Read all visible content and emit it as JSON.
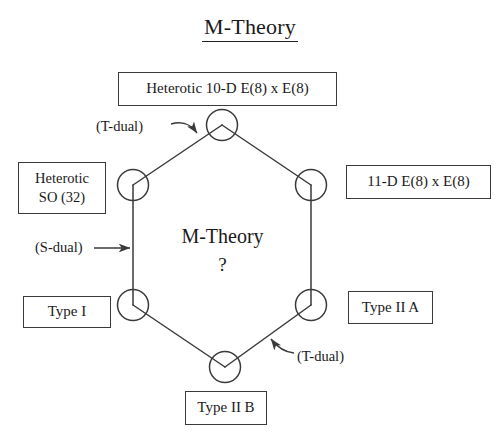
{
  "title": "M-Theory",
  "center": {
    "name": "M-Theory",
    "question": "?"
  },
  "nodes": {
    "heterotic_10d": "Heterotic 10-D E(8) x E(8)",
    "heterotic_so32": "Heterotic\nSO (32)",
    "eleven_d": "11-D  E(8) x E(8)",
    "type_i": "Type I",
    "type_iia": "Type II A",
    "type_iib": "Type II B"
  },
  "dualities": {
    "t_dual_top": "(T-dual)",
    "s_dual": "(S-dual)",
    "t_dual_bottom": "(T-dual)"
  },
  "colors": {
    "line": "#3a3a3a",
    "text": "#1a1a1a",
    "background": "#ffffff"
  }
}
